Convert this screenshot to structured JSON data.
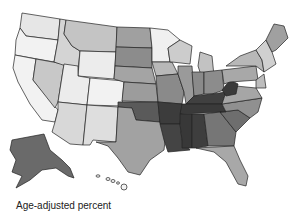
{
  "map": {
    "title": "",
    "subject": "US counties choropleth",
    "legend_label": "Age-adjusted percent",
    "palette": {
      "lowest": "#f2f2f2",
      "low": "#cfcfcf",
      "mid": "#a8a8a8",
      "high": "#7a7a7a",
      "highest": "#3c3c3c",
      "border": "#222222",
      "background": "#ffffff"
    },
    "regions": [
      {
        "name": "Pacific Northwest",
        "level": "lowest"
      },
      {
        "name": "California",
        "level": "lowest"
      },
      {
        "name": "Nevada",
        "level": "low"
      },
      {
        "name": "Idaho",
        "level": "low"
      },
      {
        "name": "Montana",
        "level": "low"
      },
      {
        "name": "Wyoming",
        "level": "lowest"
      },
      {
        "name": "Utah",
        "level": "lowest"
      },
      {
        "name": "Colorado",
        "level": "lowest"
      },
      {
        "name": "Arizona",
        "level": "low"
      },
      {
        "name": "New Mexico",
        "level": "low"
      },
      {
        "name": "Dakotas",
        "level": "mid"
      },
      {
        "name": "Nebraska/Kansas",
        "level": "mid"
      },
      {
        "name": "Minnesota",
        "level": "lowest"
      },
      {
        "name": "Wisconsin",
        "level": "low"
      },
      {
        "name": "Iowa/Missouri",
        "level": "mid"
      },
      {
        "name": "Texas",
        "level": "mid"
      },
      {
        "name": "Oklahoma",
        "level": "high"
      },
      {
        "name": "Great Lakes",
        "level": "mid"
      },
      {
        "name": "Northeast",
        "level": "low"
      },
      {
        "name": "Maine",
        "level": "mid"
      },
      {
        "name": "Appalachia",
        "level": "highest"
      },
      {
        "name": "Deep South",
        "level": "highest"
      },
      {
        "name": "Southeast Atlantic",
        "level": "mid"
      },
      {
        "name": "Florida",
        "level": "low"
      },
      {
        "name": "Alaska",
        "level": "high"
      },
      {
        "name": "Hawaii",
        "level": "lowest"
      }
    ]
  }
}
